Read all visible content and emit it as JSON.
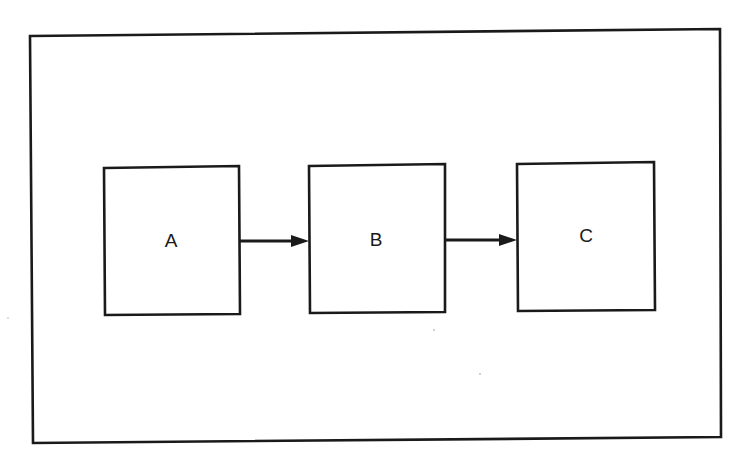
{
  "diagram": {
    "type": "flowchart",
    "direction": "left-to-right",
    "colors": {
      "stroke": "#1a1a1a",
      "background": "#ffffff"
    },
    "frame": {
      "x1": 30,
      "y1": 36,
      "x2": 720,
      "y2": 443
    },
    "nodes": [
      {
        "id": "A",
        "label": "A",
        "x": 103,
        "y": 167,
        "w": 137,
        "h": 148
      },
      {
        "id": "B",
        "label": "B",
        "x": 309,
        "y": 165,
        "w": 136,
        "h": 148
      },
      {
        "id": "C",
        "label": "C",
        "x": 517,
        "y": 163,
        "w": 137,
        "h": 148
      }
    ],
    "edges": [
      {
        "from": "A",
        "to": "B",
        "label": ""
      },
      {
        "from": "B",
        "to": "C",
        "label": ""
      }
    ]
  }
}
